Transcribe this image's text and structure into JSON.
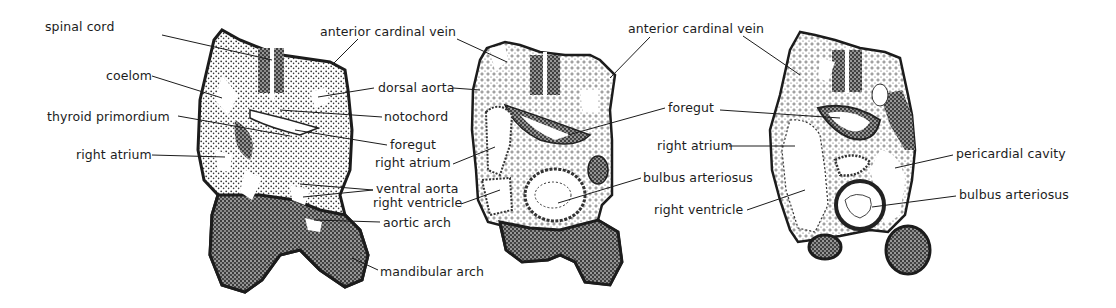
{
  "figure": {
    "type": "anatomical cross-section illustration",
    "panels": [
      {
        "id": "section-1",
        "labels": [
          {
            "text": "spinal cord",
            "x": 92,
            "y": 27
          },
          {
            "text": "coelom",
            "x": 107,
            "y": 70
          },
          {
            "text": "thyroid  primordium",
            "x": 47,
            "y": 110
          },
          {
            "text": "right atrium",
            "x": 76,
            "y": 148
          },
          {
            "text": "anterior cardinal vein",
            "x": 320,
            "y": 27
          },
          {
            "text": "dorsal aorta",
            "x": 378,
            "y": 83
          },
          {
            "text": "notochord",
            "x": 384,
            "y": 112
          },
          {
            "text": "foregut",
            "x": 390,
            "y": 140
          },
          {
            "text": "ventral aorta",
            "x": 376,
            "y": 183
          },
          {
            "text": "aortic arch",
            "x": 383,
            "y": 218
          },
          {
            "text": "mandibular arch",
            "x": 380,
            "y": 265
          }
        ]
      },
      {
        "id": "section-2",
        "labels": [
          {
            "text": "right atrium",
            "x": 375,
            "y": 158
          },
          {
            "text": "right ventricle",
            "x": 373,
            "y": 198
          },
          {
            "text": "anterior cardinal vein",
            "x": 628,
            "y": 24
          },
          {
            "text": "foregut",
            "x": 668,
            "y": 103
          },
          {
            "text": "bulbus arteriosus",
            "x": 643,
            "y": 171
          }
        ]
      },
      {
        "id": "section-3",
        "labels": [
          {
            "text": "right atrium",
            "x": 657,
            "y": 139
          },
          {
            "text": "right ventricle",
            "x": 654,
            "y": 205
          },
          {
            "text": "pericardial   cavity",
            "x": 956,
            "y": 148
          },
          {
            "text": "bulbus arteriosus",
            "x": 959,
            "y": 189
          }
        ]
      }
    ],
    "colors": {
      "ink": "#1c1c1c",
      "stipple": "#3a3a3a",
      "background": "#ffffff"
    }
  }
}
